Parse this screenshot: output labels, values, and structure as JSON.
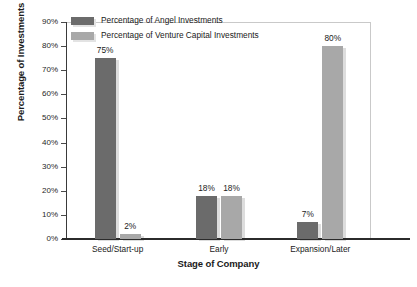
{
  "chart_data": {
    "type": "bar",
    "title": "",
    "xlabel": "Stage of Company",
    "ylabel": "Percentage of Investments",
    "categories": [
      "Seed/Start-up",
      "Early",
      "Expansion/Later"
    ],
    "series": [
      {
        "name": "Percentage of Angel Investments",
        "color": "#6b6b6b",
        "values": [
          75,
          18,
          7
        ],
        "labels": [
          "75%",
          "18%",
          "7%"
        ]
      },
      {
        "name": "Percentage of Venture Capital Investments",
        "color": "#a8a8a8",
        "values": [
          2,
          18,
          80
        ],
        "labels": [
          "2%",
          "18%",
          "80%"
        ]
      }
    ],
    "ylim": [
      0,
      90
    ],
    "yticks": [
      0,
      10,
      20,
      30,
      40,
      50,
      60,
      70,
      80,
      90
    ],
    "ytick_labels": [
      "0%",
      "10%",
      "20%",
      "30%",
      "40%",
      "50%",
      "60%",
      "70%",
      "80%",
      "90%"
    ],
    "grid": false,
    "legend_position": "top-left",
    "value_suffix": "%"
  },
  "legend": {
    "items": [
      {
        "label": "Percentage of Angel Investments",
        "color": "#6b6b6b"
      },
      {
        "label": "Percentage of Venture Capital Investments",
        "color": "#a8a8a8"
      }
    ]
  },
  "colors": {
    "angel": "#6b6b6b",
    "venture": "#a8a8a8",
    "shadow": "#dddddd",
    "axis": "#2b2b2b",
    "plot_border": "#c9c9c9",
    "text": "#1a1a1a",
    "background": "#ffffff"
  }
}
